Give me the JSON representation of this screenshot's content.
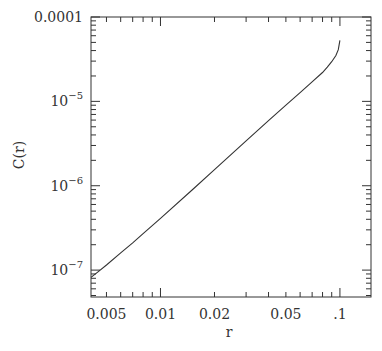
{
  "chart_data": {
    "type": "line",
    "title": "",
    "xlabel": "r",
    "ylabel": "C(r)",
    "xscale": "log",
    "yscale": "log",
    "xlim": [
      0.0041,
      0.149
    ],
    "ylim": [
      4.8e-08,
      0.0001
    ],
    "x_ticks": [
      {
        "value": 0.005,
        "label": "0.005"
      },
      {
        "value": 0.01,
        "label": "0.01"
      },
      {
        "value": 0.02,
        "label": "0.02"
      },
      {
        "value": 0.05,
        "label": "0.05"
      },
      {
        "value": 0.1,
        "label": ".1"
      }
    ],
    "y_ticks": [
      {
        "value": 1e-07,
        "label": "10",
        "exp": "−7"
      },
      {
        "value": 1e-06,
        "label": "10",
        "exp": "−6"
      },
      {
        "value": 1e-05,
        "label": "10",
        "exp": "−5"
      },
      {
        "value": 0.0001,
        "label": "0.0001",
        "exp": ""
      }
    ],
    "grid": false,
    "legend": null,
    "series": [
      {
        "name": "C(r)",
        "x": [
          0.0041,
          0.0045,
          0.005,
          0.006,
          0.007,
          0.008,
          0.01,
          0.015,
          0.02,
          0.03,
          0.04,
          0.05,
          0.06,
          0.07,
          0.08,
          0.085,
          0.09,
          0.095,
          0.098,
          0.1
        ],
        "y": [
          8.2e-08,
          9.6e-08,
          1.15e-07,
          1.6e-07,
          2.1e-07,
          2.7e-07,
          4.1e-07,
          8.9e-07,
          1.55e-06,
          3.4e-06,
          5.9e-06,
          9e-06,
          1.27e-05,
          1.7e-05,
          2.2e-05,
          2.55e-05,
          2.95e-05,
          3.5e-05,
          4.1e-05,
          5.3e-05
        ]
      }
    ]
  },
  "axes": {
    "x_label": "r",
    "y_label": "C(r)"
  }
}
